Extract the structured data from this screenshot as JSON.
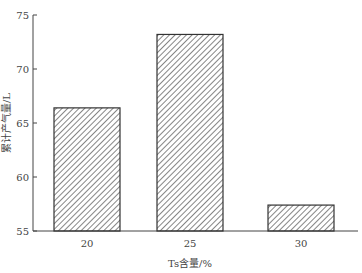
{
  "chart_data": {
    "type": "bar",
    "title": "",
    "xlabel": "Ts含量/%",
    "ylabel": "累计产气量/L",
    "categories": [
      "20",
      "25",
      "30"
    ],
    "values": [
      66.4,
      73.2,
      57.4
    ],
    "ylim": [
      55,
      75
    ],
    "yticks": [
      "55",
      "60",
      "65",
      "70",
      "75"
    ],
    "grid": false,
    "legend": null,
    "bar_fill": "diagonal-hatch",
    "colors": {
      "bar_stroke": "#333333",
      "hatch": "#333333",
      "axis": "#444444"
    }
  }
}
